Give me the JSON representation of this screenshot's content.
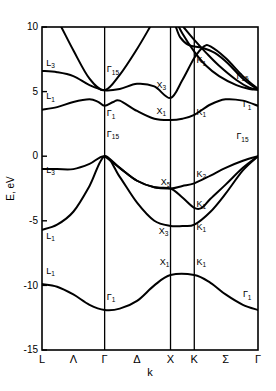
{
  "figure": {
    "title": "",
    "type": "band-structure-diagram"
  },
  "axes": {
    "y_title": "E, eV",
    "x_title": "k",
    "y_ticks": [
      "10",
      "5",
      "0",
      "-5",
      "-10",
      "-15"
    ],
    "x_ticks": [
      "L",
      "Λ",
      "Γ",
      "Δ",
      "X",
      "K",
      "Σ",
      "Γ"
    ]
  },
  "chart_data": {
    "type": "line",
    "title": "",
    "xlabel": "k",
    "ylabel": "E, eV",
    "ylim": [
      -15,
      10
    ],
    "grid": false,
    "legend": "none",
    "symmetry_points": [
      {
        "label": "L",
        "x": 0.0,
        "is_vertical_line": true
      },
      {
        "label": "Λ",
        "x": 0.145,
        "is_vertical_line": false
      },
      {
        "label": "Γ",
        "x": 0.29,
        "is_vertical_line": true
      },
      {
        "label": "Δ",
        "x": 0.44,
        "is_vertical_line": false
      },
      {
        "label": "X",
        "x": 0.595,
        "is_vertical_line": true
      },
      {
        "label": "K",
        "x": 0.705,
        "is_vertical_line": true
      },
      {
        "label": "Σ",
        "x": 0.85,
        "is_vertical_line": false
      },
      {
        "label": "Γ",
        "x": 1.0,
        "is_vertical_line": true
      }
    ],
    "annotations": [
      {
        "text": "L₃",
        "sym": "L",
        "sub": "3",
        "energy": 7.0,
        "x": 0.02
      },
      {
        "text": "L₁",
        "sym": "L",
        "sub": "1",
        "energy": 4.4,
        "x": 0.02
      },
      {
        "text": "L₃",
        "sym": "L",
        "sub": "3",
        "energy": -1.3,
        "x": 0.02
      },
      {
        "text": "L₁",
        "sym": "L",
        "sub": "1",
        "energy": -6.4,
        "x": 0.02
      },
      {
        "text": "L₁",
        "sym": "L",
        "sub": "1",
        "energy": -9.1,
        "x": 0.02
      },
      {
        "text": "Γ₁₅",
        "sym": "Γ",
        "sub": "15",
        "energy": 6.5,
        "x": 0.3
      },
      {
        "text": "Γ₁",
        "sym": "Γ",
        "sub": "1",
        "energy": 3.1,
        "x": 0.3
      },
      {
        "text": "Γ₁₅",
        "sym": "Γ",
        "sub": "15",
        "energy": 1.5,
        "x": 0.3
      },
      {
        "text": "Γ₁",
        "sym": "Γ",
        "sub": "1",
        "energy": -11.1,
        "x": 0.3
      },
      {
        "text": "X₃",
        "sym": "X",
        "sub": "3",
        "energy": 5.3,
        "x": 0.53
      },
      {
        "text": "X₁",
        "sym": "X",
        "sub": "1",
        "energy": 3.3,
        "x": 0.53
      },
      {
        "text": "X₅",
        "sym": "X",
        "sub": "5",
        "energy": -2.2,
        "x": 0.55
      },
      {
        "text": "X₃",
        "sym": "X",
        "sub": "3",
        "energy": -6.0,
        "x": 0.54
      },
      {
        "text": "X₁",
        "sym": "X",
        "sub": "1",
        "energy": -8.4,
        "x": 0.545
      },
      {
        "text": "K₁",
        "sym": "K",
        "sub": "1",
        "energy": 7.2,
        "x": 0.715
      },
      {
        "text": "K₁",
        "sym": "K",
        "sub": "1",
        "energy": 3.2,
        "x": 0.715
      },
      {
        "text": "K₂",
        "sym": "K",
        "sub": "2",
        "energy": -1.6,
        "x": 0.715
      },
      {
        "text": "K₁",
        "sym": "K",
        "sub": "1",
        "energy": -3.9,
        "x": 0.715
      },
      {
        "text": "K₁",
        "sym": "K",
        "sub": "1",
        "energy": -5.7,
        "x": 0.715
      },
      {
        "text": "K₁",
        "sym": "K",
        "sub": "1",
        "energy": -8.4,
        "x": 0.715
      },
      {
        "text": "Γ₁₅",
        "sym": "Γ",
        "sub": "15",
        "energy": 6.0,
        "x": 0.9
      },
      {
        "text": "Γ₁",
        "sym": "Γ",
        "sub": "1",
        "energy": 3.8,
        "x": 0.93
      },
      {
        "text": "Γ₁₅",
        "sym": "Γ",
        "sub": "15",
        "energy": 1.3,
        "x": 0.9
      },
      {
        "text": "Γ₁",
        "sym": "Γ",
        "sub": "1",
        "energy": -10.9,
        "x": 0.93
      }
    ],
    "series": [
      {
        "name": "valence-band-1",
        "points": [
          [
            0.0,
            -9.9
          ],
          [
            0.07,
            -10.1
          ],
          [
            0.145,
            -10.7
          ],
          [
            0.22,
            -11.5
          ],
          [
            0.29,
            -11.9
          ],
          [
            0.36,
            -11.8
          ],
          [
            0.44,
            -11.2
          ],
          [
            0.52,
            -10.0
          ],
          [
            0.595,
            -9.2
          ],
          [
            0.705,
            -9.2
          ],
          [
            0.78,
            -9.8
          ],
          [
            0.85,
            -10.7
          ],
          [
            0.93,
            -11.5
          ],
          [
            1.0,
            -11.9
          ]
        ]
      },
      {
        "name": "valence-band-2",
        "points": [
          [
            0.0,
            -5.7
          ],
          [
            0.07,
            -5.3
          ],
          [
            0.145,
            -4.3
          ],
          [
            0.22,
            -2.3
          ],
          [
            0.29,
            0.0
          ],
          [
            0.36,
            -1.6
          ],
          [
            0.44,
            -3.6
          ],
          [
            0.52,
            -5.0
          ],
          [
            0.595,
            -5.4
          ],
          [
            0.65,
            -5.4
          ],
          [
            0.705,
            -5.3
          ],
          [
            0.78,
            -4.3
          ],
          [
            0.85,
            -2.9
          ],
          [
            0.93,
            -1.1
          ],
          [
            1.0,
            0.0
          ]
        ]
      },
      {
        "name": "valence-band-3",
        "points": [
          [
            0.0,
            -1.0
          ],
          [
            0.07,
            -1.0
          ],
          [
            0.145,
            -1.0
          ],
          [
            0.22,
            -0.6
          ],
          [
            0.29,
            0.0
          ],
          [
            0.36,
            -0.9
          ],
          [
            0.44,
            -1.9
          ],
          [
            0.52,
            -2.4
          ],
          [
            0.595,
            -2.5
          ],
          [
            0.65,
            -3.2
          ],
          [
            0.705,
            -4.0
          ],
          [
            0.74,
            -4.0
          ],
          [
            0.78,
            -3.3
          ],
          [
            0.85,
            -2.2
          ],
          [
            0.93,
            -0.9
          ],
          [
            1.0,
            0.0
          ]
        ]
      },
      {
        "name": "valence-band-4",
        "points": [
          [
            0.29,
            0.0
          ],
          [
            0.36,
            -0.9
          ],
          [
            0.44,
            -1.9
          ],
          [
            0.52,
            -2.4
          ],
          [
            0.595,
            -2.5
          ],
          [
            0.65,
            -2.3
          ],
          [
            0.705,
            -2.1
          ],
          [
            0.78,
            -1.5
          ],
          [
            0.85,
            -0.9
          ],
          [
            0.93,
            -0.35
          ],
          [
            1.0,
            0.0
          ]
        ]
      },
      {
        "name": "conduction-band-1",
        "points": [
          [
            0.0,
            3.6
          ],
          [
            0.07,
            3.8
          ],
          [
            0.145,
            4.2
          ],
          [
            0.22,
            4.4
          ],
          [
            0.26,
            4.2
          ],
          [
            0.29,
            3.9
          ],
          [
            0.33,
            4.2
          ],
          [
            0.36,
            4.3
          ],
          [
            0.44,
            3.5
          ],
          [
            0.52,
            2.9
          ],
          [
            0.595,
            2.8
          ],
          [
            0.65,
            2.9
          ],
          [
            0.705,
            3.2
          ],
          [
            0.78,
            4.0
          ],
          [
            0.85,
            4.4
          ],
          [
            0.93,
            4.3
          ],
          [
            1.0,
            3.9
          ]
        ]
      },
      {
        "name": "conduction-band-2",
        "points": [
          [
            0.0,
            6.6
          ],
          [
            0.07,
            6.5
          ],
          [
            0.145,
            6.2
          ],
          [
            0.22,
            5.5
          ],
          [
            0.29,
            5.1
          ],
          [
            0.36,
            5.2
          ],
          [
            0.44,
            5.6
          ],
          [
            0.52,
            5.4
          ],
          [
            0.595,
            4.5
          ],
          [
            0.65,
            5.9
          ],
          [
            0.705,
            7.6
          ],
          [
            0.75,
            8.5
          ],
          [
            0.78,
            8.5
          ],
          [
            0.85,
            7.6
          ],
          [
            0.93,
            6.2
          ],
          [
            1.0,
            5.2
          ]
        ]
      },
      {
        "name": "conduction-band-3",
        "points": [
          [
            0.0,
            12.5
          ],
          [
            0.07,
            10.6
          ],
          [
            0.145,
            8.2
          ],
          [
            0.22,
            6.0
          ],
          [
            0.29,
            5.1
          ],
          [
            0.36,
            6.3
          ],
          [
            0.44,
            8.3
          ],
          [
            0.5,
            10.0
          ]
        ]
      },
      {
        "name": "conduction-band-4",
        "points": [
          [
            0.595,
            11.5
          ],
          [
            0.62,
            10.5
          ],
          [
            0.65,
            9.5
          ],
          [
            0.705,
            8.1
          ],
          [
            0.76,
            7.0
          ],
          [
            0.82,
            6.2
          ],
          [
            0.9,
            5.5
          ],
          [
            0.96,
            5.2
          ],
          [
            1.0,
            5.15
          ]
        ]
      },
      {
        "name": "conduction-band-5",
        "points": [
          [
            0.655,
            10.0
          ],
          [
            0.705,
            9.0
          ],
          [
            0.76,
            8.0
          ],
          [
            0.82,
            7.0
          ],
          [
            0.9,
            5.9
          ],
          [
            0.96,
            5.3
          ],
          [
            1.0,
            5.15
          ]
        ]
      },
      {
        "name": "conduction-band-6",
        "points": [
          [
            0.62,
            10.0
          ],
          [
            0.64,
            9.2
          ],
          [
            0.68,
            8.6
          ],
          [
            0.74,
            8.4
          ],
          [
            0.8,
            8.0
          ],
          [
            0.86,
            7.2
          ],
          [
            0.93,
            6.0
          ],
          [
            1.0,
            5.15
          ]
        ]
      }
    ]
  }
}
